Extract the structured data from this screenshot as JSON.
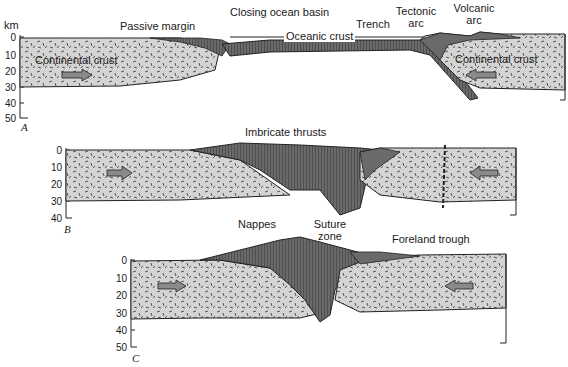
{
  "figure": {
    "unit_label": "km",
    "panels": [
      {
        "id": "A",
        "letter": "A",
        "depth_ticks": [
          "0",
          "10",
          "20",
          "30",
          "40",
          "50"
        ],
        "labels": {
          "passive_margin": "Passive margin",
          "closing_ocean_basin": "Closing ocean basin",
          "trench": "Trench",
          "tectonic_arc": "Tectonic arc",
          "tectonic_arc_l1": "Tectonic",
          "tectonic_arc_l2": "arc",
          "volcanic_arc_l1": "Volcanic",
          "volcanic_arc_l2": "arc",
          "oceanic_crust": "Oceanic crust",
          "continental_crust_left": "Continental crust",
          "continental_crust_right": "Continental crust"
        },
        "arrows": [
          "right",
          "left"
        ]
      },
      {
        "id": "B",
        "letter": "B",
        "depth_ticks": [
          "0",
          "10",
          "20",
          "30",
          "40"
        ],
        "labels": {
          "imbricate_thrusts": "Imbricate thrusts"
        },
        "arrows": [
          "right",
          "left"
        ]
      },
      {
        "id": "C",
        "letter": "C",
        "depth_ticks": [
          "0",
          "10",
          "20",
          "30",
          "40",
          "50"
        ],
        "labels": {
          "nappes": "Nappes",
          "suture_zone_l1": "Suture",
          "suture_zone_l2": "zone",
          "foreland_trough": "Foreland trough"
        },
        "arrows": [
          "right",
          "left"
        ]
      }
    ],
    "colors": {
      "crust_fill": "#d4d4d4",
      "sediment_fill": "#5a5a5a",
      "outline": "#1a1a1a",
      "arrow_fill": "#8a8a8a"
    }
  }
}
